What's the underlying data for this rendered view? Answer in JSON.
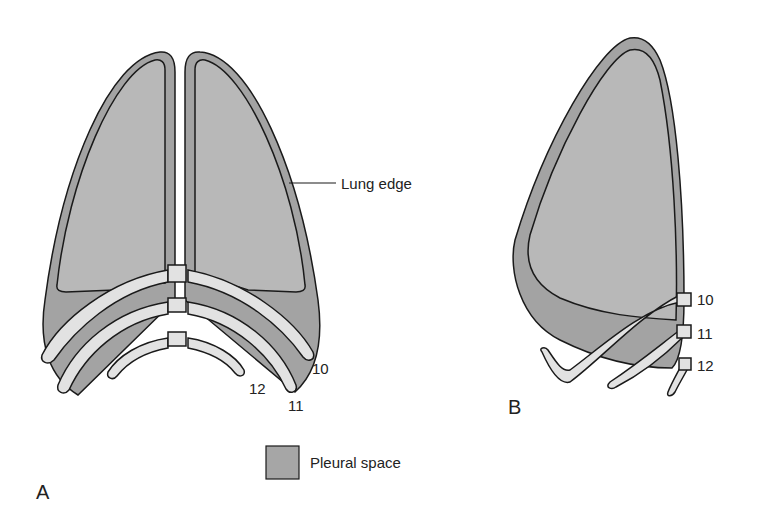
{
  "figure": {
    "panels": [
      {
        "id": "A",
        "label": "A",
        "view": "posterior view, both lungs"
      },
      {
        "id": "B",
        "label": "B",
        "view": "lateral view, single lung"
      }
    ],
    "annotations": {
      "lung_edge": "Lung edge",
      "rib_a_10": "10",
      "rib_a_11": "11",
      "rib_a_12": "12",
      "rib_b_10": "10",
      "rib_b_11": "11",
      "rib_b_12": "12"
    },
    "legend": {
      "label": "Pleural space",
      "swatch_color": "#a6a6a6"
    },
    "colors": {
      "pleura_fill": "#a3a3a3",
      "lung_fill": "#b8b8b8",
      "rib_fill": "#e2e2e2",
      "outline": "#1a1a1a"
    }
  }
}
